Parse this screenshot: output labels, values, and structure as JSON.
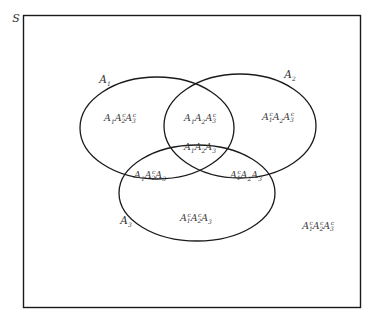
{
  "diagram": {
    "type": "venn",
    "universe_label": "S",
    "sets": [
      {
        "name": "A1",
        "label_base": "A",
        "label_sub": "1"
      },
      {
        "name": "A2",
        "label_base": "A",
        "label_sub": "2"
      },
      {
        "name": "A3",
        "label_base": "A",
        "label_sub": "3"
      }
    ],
    "regions": [
      {
        "id": "A1A2cA3c",
        "terms": [
          {
            "sub": "1",
            "c": false
          },
          {
            "sub": "2",
            "c": true
          },
          {
            "sub": "3",
            "c": true
          }
        ]
      },
      {
        "id": "A1A2A3c",
        "terms": [
          {
            "sub": "1",
            "c": false
          },
          {
            "sub": "2",
            "c": false
          },
          {
            "sub": "3",
            "c": true
          }
        ]
      },
      {
        "id": "A1cA2A3c",
        "terms": [
          {
            "sub": "1",
            "c": true
          },
          {
            "sub": "2",
            "c": false
          },
          {
            "sub": "3",
            "c": true
          }
        ]
      },
      {
        "id": "A1A2A3",
        "terms": [
          {
            "sub": "1",
            "c": false
          },
          {
            "sub": "2",
            "c": false
          },
          {
            "sub": "3",
            "c": false
          }
        ]
      },
      {
        "id": "A1A2cA3",
        "terms": [
          {
            "sub": "1",
            "c": false
          },
          {
            "sub": "2",
            "c": true
          },
          {
            "sub": "3",
            "c": false
          }
        ]
      },
      {
        "id": "A1cA2A3",
        "terms": [
          {
            "sub": "1",
            "c": true
          },
          {
            "sub": "2",
            "c": false
          },
          {
            "sub": "3",
            "c": false
          }
        ]
      },
      {
        "id": "A1cA2cA3",
        "terms": [
          {
            "sub": "1",
            "c": true
          },
          {
            "sub": "2",
            "c": true
          },
          {
            "sub": "3",
            "c": false
          }
        ]
      },
      {
        "id": "A1cA2cA3c",
        "terms": [
          {
            "sub": "1",
            "c": true
          },
          {
            "sub": "2",
            "c": true
          },
          {
            "sub": "3",
            "c": true
          }
        ]
      }
    ],
    "complement_mark": "c",
    "stroke_color": "#1a1a1a",
    "text_color": "#3a3a3a"
  }
}
